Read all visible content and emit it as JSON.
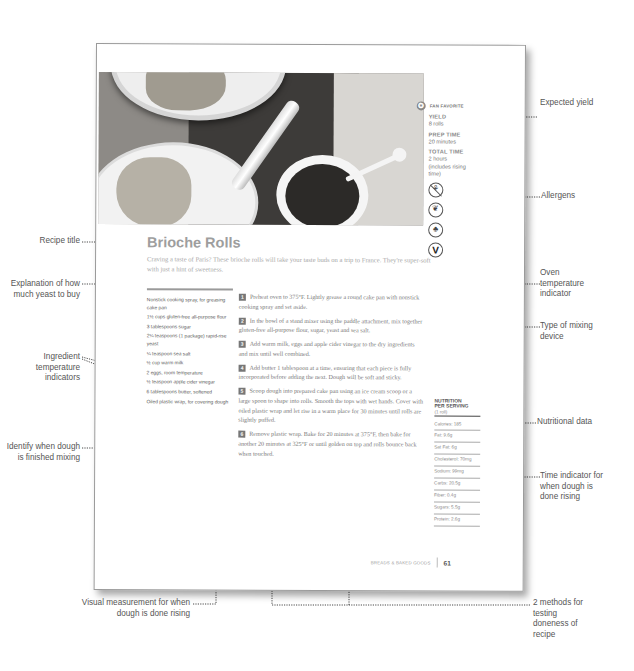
{
  "page": {
    "badge": {
      "icon": "star-icon",
      "label": "FAN FAVORITE"
    },
    "meta": [
      {
        "label": "YIELD",
        "value": "8 rolls"
      },
      {
        "label": "PREP TIME",
        "value": "20 minutes"
      },
      {
        "label": "TOTAL TIME",
        "value": "2 hours (includes rising time)"
      }
    ],
    "allergens": [
      {
        "icon": "gluten-free-icon",
        "glyph": "⚘"
      },
      {
        "icon": "nut-free-leaf-icon",
        "glyph": "❦"
      },
      {
        "icon": "acorn-icon",
        "glyph": "♣"
      },
      {
        "icon": "vegetarian-icon",
        "glyph": "V"
      }
    ],
    "title": "Brioche Rolls",
    "intro": "Craving a taste of Paris? These brioche rolls will take your taste buds on a trip to France. They're super-soft with just a hint of sweetness.",
    "ingredients": [
      "Nonstick cooking spray, for greasing cake pan",
      "1½ cups gluten-free all-purpose flour",
      "3 tablespoons sugar",
      "2¼ teaspoons (1 package) rapid-rise yeast",
      "¼ teaspoon sea salt",
      "½ cup warm milk",
      "2 eggs, room temperature",
      "½ teaspoon apple cider vinegar",
      "6 tablespoons butter, softened",
      "Oiled plastic wrap, for covering dough"
    ],
    "steps": [
      {
        "num": "1",
        "text": "Preheat oven to 375°F. Lightly grease a round cake pan with nonstick cooking spray and set aside."
      },
      {
        "num": "2",
        "text": "In the bowl of a stand mixer using the paddle attachment, mix together gluten-free all-purpose flour, sugar, yeast and sea salt."
      },
      {
        "num": "3",
        "text": "Add warm milk, eggs and apple cider vinegar to the dry ingredients and mix until well combined."
      },
      {
        "num": "4",
        "text": "Add butter 1 tablespoon at a time, ensuring that each piece is fully incorporated before adding the next. Dough will be soft and sticky."
      },
      {
        "num": "5",
        "text": "Scoop dough into prepared cake pan using an ice cream scoop or a large spoon to shape into rolls. Smooth the tops with wet hands. Cover with oiled plastic wrap and let rise in a warm place for 30 minutes until rolls are slightly puffed."
      },
      {
        "num": "6",
        "text": "Remove plastic wrap. Bake for 20 minutes at 375°F, then bake for another 20 minutes at 325°F or until golden on top and rolls bounce back when touched."
      }
    ],
    "nutrition": {
      "heading_line1": "NUTRITION",
      "heading_line2": "PER SERVING",
      "serving": "(1 roll)",
      "rows": [
        "Calories: 185",
        "Fat: 9.6g",
        "Sat Fat: 6g",
        "Cholesterol: 70mg",
        "Sodium: 99mg",
        "Carbs: 20.5g",
        "Fiber: 0.4g",
        "Sugars: 5.5g",
        "Protein: 2.6g"
      ]
    },
    "footer": {
      "section": "BREADS & BAKED GOODS",
      "page_number": "61"
    }
  },
  "annotations": {
    "left": [
      "Recipe title",
      "Explanation of how much yeast to buy",
      "Ingredient temperature indicators",
      "Identify when dough is finished mixing"
    ],
    "right": [
      "Expected yield",
      "Allergens",
      "Oven temperature indicator",
      "Type of mixing device",
      "Nutritional data",
      "Time indicator for when dough is done rising",
      "2 methods for testing doneness of recipe"
    ],
    "bottom": [
      "Visual measurement for when dough is done rising"
    ]
  }
}
